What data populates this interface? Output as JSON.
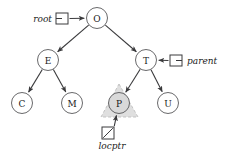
{
  "figure": {
    "kind": "binary-search-tree-diagram",
    "width": 225,
    "height": 159,
    "background": "#ffffff",
    "stroke_color": "#58585a",
    "text_color": "#1a1a1a",
    "highlight_fill": "#d9d9d9",
    "highlight_stroke": "#bdbdbd",
    "node_fill": "#ffffff",
    "node_radius": 10.5
  },
  "nodes": [
    {
      "id": "O",
      "label": "O",
      "cx": 97,
      "cy": 18,
      "highlighted": false
    },
    {
      "id": "E",
      "label": "E",
      "cx": 48,
      "cy": 60,
      "highlighted": false
    },
    {
      "id": "T",
      "label": "T",
      "cx": 146,
      "cy": 60,
      "highlighted": false
    },
    {
      "id": "C",
      "label": "C",
      "cx": 22,
      "cy": 103,
      "highlighted": false
    },
    {
      "id": "M",
      "label": "M",
      "cx": 72,
      "cy": 103,
      "highlighted": false
    },
    {
      "id": "P",
      "label": "P",
      "cx": 119,
      "cy": 103,
      "highlighted": true
    },
    {
      "id": "U",
      "label": "U",
      "cx": 168,
      "cy": 103,
      "highlighted": false
    }
  ],
  "edges": [
    {
      "from": "O",
      "to": "E"
    },
    {
      "from": "O",
      "to": "T"
    },
    {
      "from": "E",
      "to": "C"
    },
    {
      "from": "E",
      "to": "M"
    },
    {
      "from": "T",
      "to": "P"
    },
    {
      "from": "T",
      "to": "U"
    }
  ],
  "pointers": [
    {
      "id": "root",
      "label": "root",
      "target": "O",
      "label_x": 52,
      "label_y": 19,
      "label_side": "left",
      "box_x": 56,
      "box_y": 13,
      "box_w": 12,
      "box_h": 11
    },
    {
      "id": "parent",
      "label": "parent",
      "target": "T",
      "label_x": 187,
      "label_y": 61,
      "label_side": "right",
      "box_x": 170,
      "box_y": 55,
      "box_w": 12,
      "box_h": 11
    },
    {
      "id": "locptr",
      "label": "locptr",
      "target": "P",
      "label_x": 112,
      "label_y": 146,
      "label_side": "mid",
      "box_x": 102,
      "box_y": 127,
      "box_w": 12,
      "box_h": 12
    }
  ],
  "highlight_triangle": {
    "around_node": "P",
    "apex_x": 119,
    "apex_y": 84,
    "left_x": 101,
    "left_y": 117,
    "right_x": 138,
    "right_y": 117
  }
}
